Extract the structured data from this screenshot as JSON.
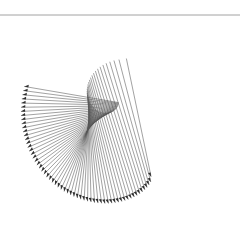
{
  "figure": {
    "type": "string-art spiral of arrow segments",
    "width": 240,
    "height": 244,
    "background": "#ffffff",
    "rule_line": {
      "y": 15,
      "x1": 0,
      "x2": 240,
      "color": "#8a8a8a"
    },
    "segment_color": "#555555",
    "arrow_color": "#2f2f2f",
    "segment_count": 60,
    "outer": {
      "center": [
        122,
        122
      ],
      "start_angle_deg": -62,
      "end_angle_deg": -200,
      "radius_start": 62,
      "radius_end": 104
    },
    "inner": {
      "center": [
        112,
        98
      ],
      "start_angle_deg": -70,
      "end_angle_deg": -325,
      "radius_start": 42,
      "radius_end": 8
    },
    "arrow_size": 4.2
  }
}
